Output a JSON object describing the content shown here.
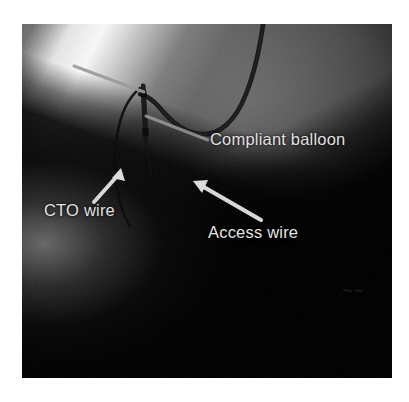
{
  "figure": {
    "kind": "fluoroscopy-angiogram-still",
    "modality": "coronary angiography / fluoroscopy",
    "frame": {
      "left": 22,
      "top": 24,
      "width": 370,
      "height": 354,
      "background_color": "#0a0a0a",
      "page_background_color": "#ffffff"
    }
  },
  "annotations": {
    "label_color": "#e3e3e1",
    "leader_line_color": "#9a9a98",
    "arrow_color": "#d8d8d6",
    "items": [
      {
        "id": "compliant-balloon",
        "label": "Compliant balloon",
        "pointer_type": "leader-line",
        "points_to": "vertical radiopaque balloon shaft, image center-left"
      },
      {
        "id": "cto-wire",
        "label": "CTO wire",
        "pointer_type": "arrow",
        "arrow_direction": "up-right",
        "points_to": "thin dark guidewire descending left of the balloon"
      },
      {
        "id": "access-wire",
        "label": "Access wire",
        "pointer_type": "arrow",
        "arrow_direction": "up-left",
        "points_to": "guidewire entering from lower field"
      },
      {
        "id": "balloon-top-leader",
        "label": "",
        "pointer_type": "leader-line",
        "points_to": "proximal balloon / catheter tip at top of device"
      }
    ]
  },
  "devices": [
    {
      "id": "guide-catheter",
      "description": "dark curved guide catheter sweeping from upper right across mid field"
    },
    {
      "id": "balloon-shaft",
      "description": "short vertical radiopaque balloon with marker bands"
    },
    {
      "id": "cto-guidewire",
      "description": "fine dark wire curving down and left from the balloon tip"
    }
  ]
}
